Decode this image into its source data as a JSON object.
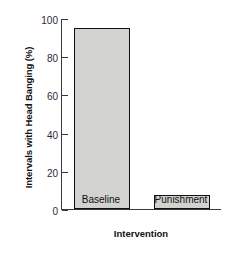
{
  "chart_data": {
    "type": "bar",
    "title": "",
    "categories": [
      "Baseline",
      "Punishment"
    ],
    "values": [
      95,
      7.5
    ],
    "xlabel": "Intervention",
    "ylabel": "Intervals with Head Banging (%)",
    "ylim": [
      0,
      100
    ],
    "yticks": [
      0,
      20,
      40,
      60,
      80,
      100
    ],
    "ytick_labels": [
      "0",
      "20",
      "40",
      "60",
      "80",
      "100"
    ],
    "grid": false,
    "legend": null,
    "bar_fill_color": "#d2d2ce",
    "bar_edge_color": "#111111",
    "axis_color": "#3a3a3a",
    "background_color": "#ffffff"
  }
}
